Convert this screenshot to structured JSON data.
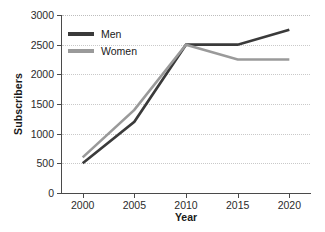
{
  "chart_data": {
    "type": "line",
    "title": "",
    "xlabel": "Year",
    "ylabel": "Subscribers",
    "categories": [
      "2000",
      "2005",
      "2010",
      "2015",
      "2020"
    ],
    "x": [
      2000,
      2005,
      2010,
      2015,
      2020
    ],
    "xlim": [
      1998,
      2022
    ],
    "ylim": [
      0,
      3000
    ],
    "yticks": [
      "0",
      "500",
      "1000",
      "1500",
      "2000",
      "2500",
      "3000"
    ],
    "ytick_values": [
      0,
      500,
      1000,
      1500,
      2000,
      2500,
      3000
    ],
    "grid": "horizontal-dotted",
    "legend_position": "top-left-inside",
    "series": [
      {
        "name": "Men",
        "color": "#3a3a3a",
        "values": [
          500,
          1200,
          2500,
          2500,
          2750
        ]
      },
      {
        "name": "Women",
        "color": "#9a9a9a",
        "values": [
          600,
          1400,
          2500,
          2250,
          2250
        ]
      }
    ]
  },
  "legend": {
    "items": [
      {
        "label": "Men"
      },
      {
        "label": "Women"
      }
    ]
  },
  "colors": {
    "men": "#3a3a3a",
    "women": "#9a9a9a",
    "axis": "#4a4a4a",
    "grid": "#c9c9c9",
    "text": "#1a1a1a",
    "background": "#ffffff"
  }
}
